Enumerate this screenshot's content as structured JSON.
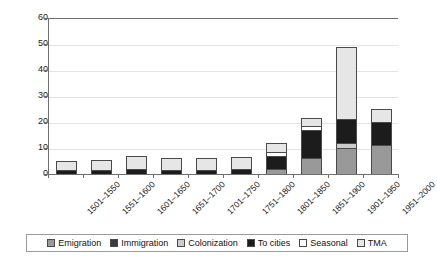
{
  "chart_data": {
    "type": "bar",
    "stacked": true,
    "title": "",
    "xlabel": "",
    "ylabel": "",
    "ylim": [
      0,
      60
    ],
    "yticks": [
      0,
      10,
      20,
      30,
      40,
      50,
      60
    ],
    "grid": true,
    "legend_position": "bottom",
    "categories": [
      "1501–1550",
      "1551–1600",
      "1601–1650",
      "1651–1700",
      "1701–1750",
      "1751–1800",
      "1801–1850",
      "1851–1900",
      "1901–1950",
      "1951–2000"
    ],
    "series": [
      {
        "name": "Emigration",
        "color": "#999999",
        "values": [
          0,
          0,
          0,
          0,
          0,
          0,
          2,
          6,
          10,
          11
        ]
      },
      {
        "name": "Immigration",
        "color": "#3a3a3a",
        "values": [
          0,
          0,
          0,
          0,
          0,
          0,
          0,
          0,
          0,
          0
        ]
      },
      {
        "name": "Colonization",
        "color": "#cccccc",
        "values": [
          0,
          0,
          0,
          0,
          0,
          0,
          0,
          0,
          2,
          0
        ]
      },
      {
        "name": "To cities",
        "color": "#1c1c1c",
        "values": [
          1.5,
          1.5,
          2,
          1.5,
          1.5,
          2,
          5,
          11,
          9,
          9
        ]
      },
      {
        "name": "Seasonal",
        "color": "#ffffff",
        "values": [
          0,
          0,
          0,
          0,
          0,
          0,
          1.5,
          1.5,
          0,
          0
        ]
      },
      {
        "name": "TMA",
        "color": "#e6e6e6",
        "values": [
          3.5,
          4,
          5,
          4.5,
          4.5,
          4.5,
          3.5,
          3,
          28,
          5
        ]
      }
    ],
    "totals": [
      5,
      5.5,
      7,
      6,
      6,
      6.5,
      12,
      21.5,
      49,
      25
    ]
  }
}
